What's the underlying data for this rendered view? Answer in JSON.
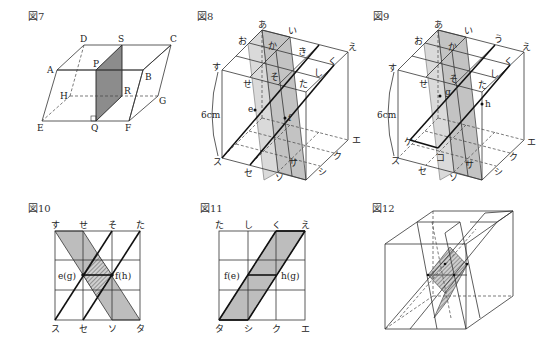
{
  "figures": {
    "fig7": {
      "title": "図7",
      "vertices": {
        "A": "A",
        "B": "B",
        "C": "C",
        "D": "D",
        "E": "E",
        "F": "F",
        "G": "G",
        "H": "H",
        "P": "P",
        "Q": "Q",
        "R": "R",
        "S": "S"
      },
      "shaded_face": "PQRS"
    },
    "fig8": {
      "title": "図8",
      "labels": {
        "a": "あ",
        "i": "い",
        "e": "え",
        "o": "お",
        "ka": "か",
        "ki": "き",
        "ku": "く",
        "shi": "し",
        "su": "す",
        "se": "せ",
        "so": "そ",
        "ta": "た",
        "pe": "e",
        "pf": "f",
        "KE": "エ",
        "KU": "ク",
        "SHI": "シ",
        "SU": "ス",
        "SE": "セ",
        "SO": "ソ",
        "SA": "サ",
        "TA": "タ"
      },
      "dimension": "6cm"
    },
    "fig9": {
      "title": "図9",
      "labels": {
        "a": "あ",
        "i": "い",
        "u": "う",
        "e": "え",
        "o": "お",
        "ka": "か",
        "ku": "く",
        "shi": "し",
        "su": "す",
        "se": "せ",
        "so": "そ",
        "ta": "た",
        "pg": "g",
        "ph": "h",
        "KE": "エ",
        "KU": "ク",
        "SHI": "シ",
        "SU": "ス",
        "SE": "セ",
        "SO": "ソ",
        "SA": "サ",
        "TA": "タ",
        "KE2": "ケ",
        "KO": "コ"
      },
      "dimension": "6cm"
    },
    "fig10": {
      "title": "図10",
      "top_labels": [
        "す",
        "せ",
        "そ",
        "た"
      ],
      "bottom_labels": [
        "ス",
        "セ",
        "ソ",
        "タ"
      ],
      "left_point": "e(g)",
      "right_point": "f(h)"
    },
    "fig11": {
      "title": "図11",
      "top_labels": [
        "た",
        "し",
        "く",
        "え"
      ],
      "bottom_labels": [
        "タ",
        "シ",
        "ク",
        "エ"
      ],
      "left_point": "f(e)",
      "right_point": "h(g)"
    },
    "fig12": {
      "title": "図12"
    }
  }
}
